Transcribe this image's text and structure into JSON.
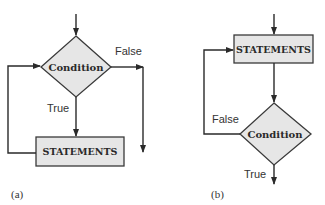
{
  "diagram": {
    "panels": [
      {
        "id": "a",
        "caption": "(a)",
        "nodes": {
          "decision": {
            "type": "diamond",
            "label": "Condition"
          },
          "process": {
            "type": "rectangle",
            "label": "STATEMENTS"
          }
        },
        "edges": [
          {
            "from": "entry",
            "to": "decision",
            "label": ""
          },
          {
            "from": "decision",
            "to": "process",
            "label": "True"
          },
          {
            "from": "decision",
            "to": "exit",
            "label": "False"
          },
          {
            "from": "process",
            "to": "decision",
            "label": ""
          }
        ],
        "labels": {
          "true": "True",
          "false": "False"
        }
      },
      {
        "id": "b",
        "caption": "(b)",
        "nodes": {
          "process": {
            "type": "rectangle",
            "label": "STATEMENTS"
          },
          "decision": {
            "type": "diamond",
            "label": "Condition"
          }
        },
        "edges": [
          {
            "from": "entry",
            "to": "process",
            "label": ""
          },
          {
            "from": "process",
            "to": "decision",
            "label": ""
          },
          {
            "from": "decision",
            "to": "process",
            "label": "False"
          },
          {
            "from": "decision",
            "to": "exit",
            "label": "True"
          }
        ],
        "labels": {
          "true": "True",
          "false": "False"
        }
      }
    ],
    "colors": {
      "shape_fill": "#e6e6e6",
      "stroke": "#2a2a2a",
      "background": "#ffffff"
    }
  }
}
